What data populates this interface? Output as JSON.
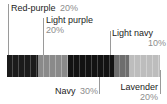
{
  "chart_data": {
    "type": "bar",
    "title": "",
    "xlabel": "",
    "ylabel": "",
    "orientation": "horizontal",
    "stacked": true,
    "total": "100%",
    "categories": [
      "Red-purple",
      "Light purple",
      "Navy",
      "Light navy",
      "Lavender"
    ],
    "values": [
      20,
      20,
      30,
      10,
      20
    ],
    "value_labels": [
      "20%",
      "20%",
      "30%",
      "10%",
      "20%"
    ],
    "colors": [
      "#1b1b1b",
      "#8a8a8a",
      "#121212",
      "#6e6e6e",
      "#bdbdbd"
    ],
    "legend": "callout-labels",
    "grid": false
  },
  "segments": [
    {
      "id": "red-purple",
      "name": "Red-purple",
      "pct": "20%",
      "color": "#1b1b1b"
    },
    {
      "id": "light-purple",
      "name": "Light purple",
      "pct": "20%",
      "color": "#8a8a8a"
    },
    {
      "id": "navy",
      "name": "Navy",
      "pct": "30%",
      "color": "#121212"
    },
    {
      "id": "light-navy",
      "name": "Light navy",
      "pct": "10%",
      "color": "#6e6e6e"
    },
    {
      "id": "lavender",
      "name": "Lavender",
      "pct": "20%",
      "color": "#bdbdbd"
    }
  ],
  "callouts": {
    "red_purple": {
      "name": "Red-purple",
      "pct": "20%"
    },
    "light_purple": {
      "name": "Light purple",
      "pct": "20%"
    },
    "navy": {
      "name": "Navy",
      "pct": "30%"
    },
    "light_navy": {
      "name": "Light navy",
      "pct": "10%"
    },
    "lavender": {
      "name": "Lavender",
      "pct": "20%"
    }
  },
  "style": {
    "label_color": "#1c1c1c",
    "pct_color": "#8d8d8d",
    "leader_color": "#9a9a9a",
    "background": "#ffffff"
  }
}
